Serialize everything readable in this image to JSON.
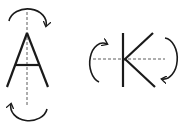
{
  "diagram": {
    "colors": {
      "stroke": "#1a1a1a",
      "axis": "#333333",
      "background": "#ffffff"
    },
    "figures": [
      {
        "letter": "A",
        "axis": "vertical",
        "rotation_arrows": [
          "top-clockwise",
          "bottom-clockwise"
        ]
      },
      {
        "letter": "K",
        "axis": "horizontal",
        "rotation_arrows": [
          "left-clockwise",
          "right-clockwise"
        ]
      }
    ]
  }
}
